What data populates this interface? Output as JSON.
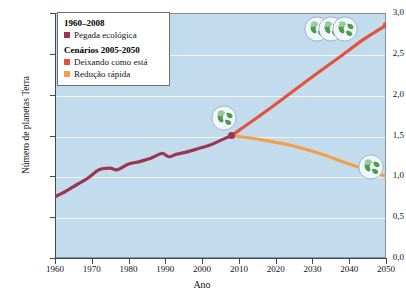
{
  "chart_data": {
    "type": "line",
    "title": "",
    "xlabel": "Ano",
    "ylabel": "Número de planetas Terra",
    "xlim": [
      1960,
      2050
    ],
    "ylim": [
      0.0,
      3.0
    ],
    "grid": true,
    "legend_position": "top-left",
    "xticks": [
      "1960",
      "1970",
      "1980",
      "1990",
      "2000",
      "2010",
      "2020",
      "2030",
      "2040",
      "2050"
    ],
    "xtick_values": [
      1960,
      1970,
      1980,
      1990,
      2000,
      2010,
      2020,
      2030,
      2040,
      2050
    ],
    "yticks": [
      "0,0",
      "0,5",
      "1,0",
      "1,5",
      "2,0",
      "2,5",
      "3,0"
    ],
    "ytick_values": [
      0.0,
      0.5,
      1.0,
      1.5,
      2.0,
      2.5,
      3.0
    ],
    "series": [
      {
        "name": "Pegada ecológica",
        "period": "1960–2008",
        "color": "#9c3551",
        "x": [
          1960,
          1963,
          1966,
          1969,
          1972,
          1975,
          1977,
          1980,
          1983,
          1986,
          1989,
          1991,
          1993,
          1996,
          1999,
          2002,
          2005,
          2008
        ],
        "values": [
          0.75,
          0.82,
          0.9,
          0.98,
          1.08,
          1.1,
          1.08,
          1.15,
          1.18,
          1.22,
          1.28,
          1.24,
          1.27,
          1.3,
          1.34,
          1.38,
          1.44,
          1.5
        ]
      },
      {
        "name": "Deixando como está",
        "period": "2005-2050",
        "color": "#e2543a",
        "x": [
          2008,
          2015,
          2022,
          2030,
          2038,
          2044,
          2050
        ],
        "values": [
          1.5,
          1.72,
          1.95,
          2.22,
          2.48,
          2.68,
          2.85
        ]
      },
      {
        "name": "Redução rápida",
        "period": "2005-2050",
        "color": "#f0a04b",
        "x": [
          2008,
          2016,
          2024,
          2032,
          2040,
          2050
        ],
        "values": [
          1.5,
          1.45,
          1.38,
          1.28,
          1.15,
          1.0
        ]
      }
    ],
    "annotations": [
      {
        "name": "three-earths",
        "label": "3 planetas Terra",
        "x": 2035,
        "y": 2.8,
        "count": 3
      },
      {
        "name": "one-point-five-earths",
        "label": "1,5 planeta Terra",
        "x": 2006,
        "y": 1.72,
        "count": 1
      },
      {
        "name": "one-earth",
        "label": "1 planeta Terra",
        "x": 2046,
        "y": 1.12,
        "count": 1
      }
    ],
    "branch_point": {
      "x": 2008,
      "y": 1.5,
      "color": "#9c3551"
    },
    "background_color": "#c3dced",
    "gridline_color": "#eef6fb"
  },
  "legend": {
    "heading_historical": "1960–2008",
    "heading_scenarios": "Cenários 2005-2050",
    "items": [
      {
        "label": "Pegada ecológica",
        "color": "#9c3551"
      },
      {
        "label": "Deixando como está",
        "color": "#e2543a"
      },
      {
        "label": "Redução rápida",
        "color": "#f0a04b"
      }
    ]
  },
  "axes": {
    "y_title": "Número de planetas Terra",
    "x_title": "Ano"
  }
}
